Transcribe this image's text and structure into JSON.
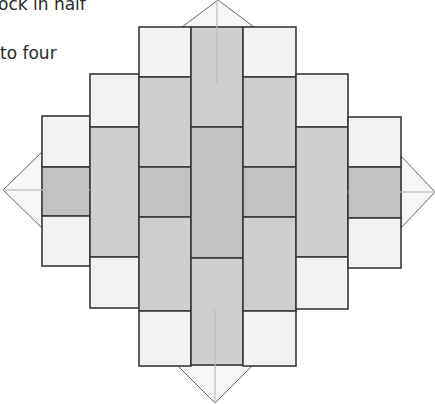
{
  "captions": [
    {
      "text": "ock in half",
      "x": -2,
      "y": -4
    },
    {
      "text": "to four",
      "x": 0,
      "y": 45
    }
  ],
  "colors": {
    "light": "#f2f2f2",
    "medium": "#cfcfcf",
    "dark": "#c2c2c2",
    "stroke": "#3a3a3a",
    "triangle_fill": "#f6f6f6",
    "triangle_stroke": "#6a6a6a",
    "fold_line": "#bdbdbd"
  },
  "diagram": {
    "patches": [
      {
        "x": 42,
        "y": 116,
        "w": 48,
        "h": 51,
        "fill": "light"
      },
      {
        "x": 42,
        "y": 167,
        "w": 48,
        "h": 49,
        "fill": "dark"
      },
      {
        "x": 42,
        "y": 216,
        "w": 48,
        "h": 50,
        "fill": "light"
      },
      {
        "x": 90,
        "y": 74,
        "w": 49,
        "h": 53,
        "fill": "light"
      },
      {
        "x": 90,
        "y": 127,
        "w": 49,
        "h": 130,
        "fill": "medium"
      },
      {
        "x": 90,
        "y": 257,
        "w": 49,
        "h": 51,
        "fill": "light"
      },
      {
        "x": 139,
        "y": 27,
        "w": 52,
        "h": 50,
        "fill": "light"
      },
      {
        "x": 139,
        "y": 77,
        "w": 52,
        "h": 90,
        "fill": "medium"
      },
      {
        "x": 139,
        "y": 167,
        "w": 52,
        "h": 50,
        "fill": "dark"
      },
      {
        "x": 139,
        "y": 217,
        "w": 52,
        "h": 94,
        "fill": "medium"
      },
      {
        "x": 139,
        "y": 311,
        "w": 52,
        "h": 55,
        "fill": "light"
      },
      {
        "x": 191,
        "y": 27,
        "w": 52,
        "h": 100,
        "fill": "medium"
      },
      {
        "x": 191,
        "y": 127,
        "w": 52,
        "h": 131,
        "fill": "dark"
      },
      {
        "x": 191,
        "y": 258,
        "w": 52,
        "h": 107,
        "fill": "medium"
      },
      {
        "x": 243,
        "y": 27,
        "w": 53,
        "h": 50,
        "fill": "light"
      },
      {
        "x": 243,
        "y": 77,
        "w": 53,
        "h": 90,
        "fill": "medium"
      },
      {
        "x": 243,
        "y": 167,
        "w": 53,
        "h": 50,
        "fill": "dark"
      },
      {
        "x": 243,
        "y": 217,
        "w": 53,
        "h": 94,
        "fill": "medium"
      },
      {
        "x": 243,
        "y": 311,
        "w": 53,
        "h": 55,
        "fill": "light"
      },
      {
        "x": 296,
        "y": 74,
        "w": 52,
        "h": 53,
        "fill": "light"
      },
      {
        "x": 296,
        "y": 127,
        "w": 52,
        "h": 130,
        "fill": "medium"
      },
      {
        "x": 296,
        "y": 257,
        "w": 52,
        "h": 52,
        "fill": "light"
      },
      {
        "x": 348,
        "y": 117,
        "w": 53,
        "h": 50,
        "fill": "light"
      },
      {
        "x": 348,
        "y": 167,
        "w": 53,
        "h": 51,
        "fill": "dark"
      },
      {
        "x": 348,
        "y": 218,
        "w": 53,
        "h": 50,
        "fill": "light"
      }
    ],
    "flaps": [
      {
        "name": "top",
        "points": "182,27 218,0 254,27"
      },
      {
        "name": "left",
        "points": "42,152 3,190 42,228"
      },
      {
        "name": "right",
        "points": "401,156 435,192 401,228"
      },
      {
        "name": "bottom",
        "points": "177,365 215,403 253,365"
      }
    ],
    "fold_lines": [
      {
        "x1": 217,
        "y1": 0,
        "x2": 217,
        "y2": 85
      },
      {
        "x1": 3,
        "y1": 190,
        "x2": 90,
        "y2": 190
      },
      {
        "x1": 348,
        "y1": 192,
        "x2": 435,
        "y2": 192
      },
      {
        "x1": 215,
        "y1": 310,
        "x2": 215,
        "y2": 403
      }
    ]
  }
}
